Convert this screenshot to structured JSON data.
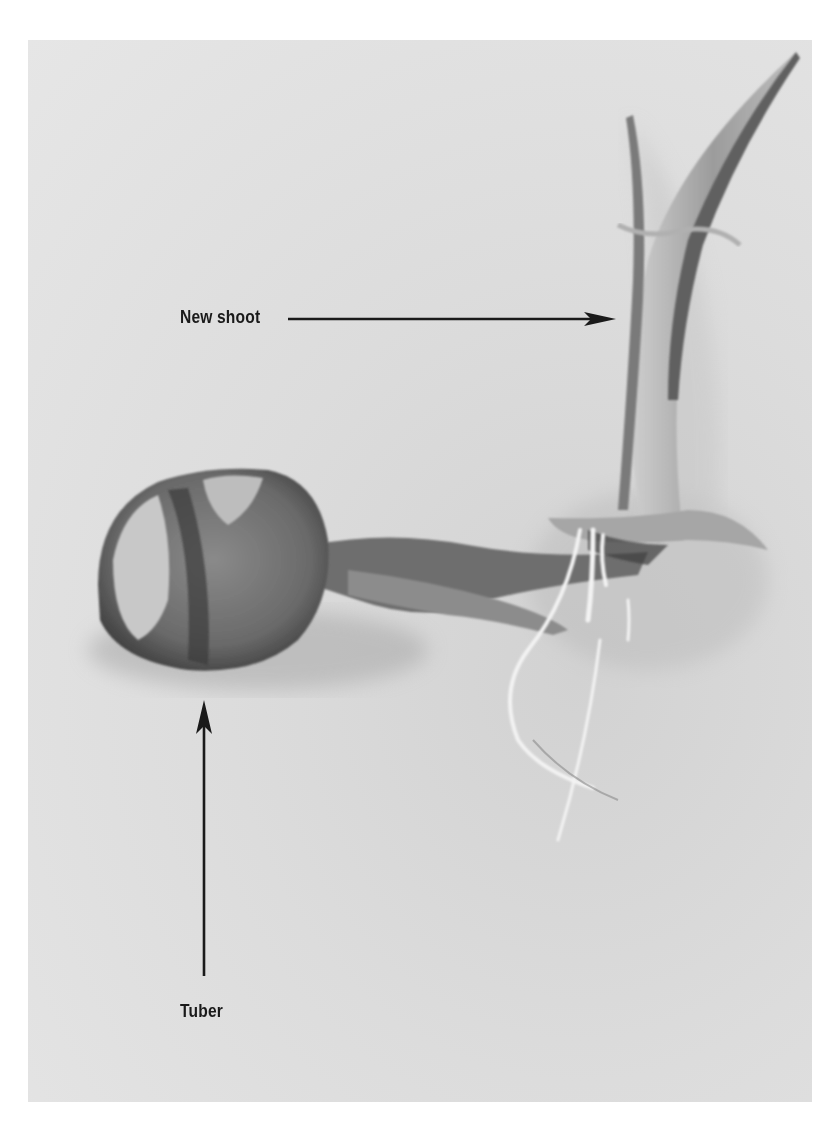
{
  "figure": {
    "background_color": "#ffffff",
    "photo_tone": "grayscale"
  },
  "annotations": [
    {
      "label": "New shoot",
      "arrow_direction": "right",
      "points_to": "shoot"
    },
    {
      "label": "Tuber",
      "arrow_direction": "up",
      "points_to": "tuber"
    }
  ],
  "colors": {
    "label_text": "#1a1a1a",
    "arrow": "#1a1a1a",
    "photo_background": "#dedede",
    "tuber_dark": "#4a4a4a",
    "tuber_light": "#9a9a9a",
    "roots": "#f2f2f2"
  }
}
